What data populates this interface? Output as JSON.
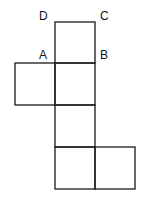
{
  "diagram": {
    "type": "cube-net",
    "line_color": "#1a1a1a",
    "labels": [
      {
        "id": "D",
        "text": "D",
        "x": 39,
        "y": 10
      },
      {
        "id": "C",
        "text": "C",
        "x": 100,
        "y": 10
      },
      {
        "id": "A",
        "text": "A",
        "x": 39,
        "y": 49
      },
      {
        "id": "B",
        "text": "B",
        "x": 100,
        "y": 49
      }
    ],
    "squares": [
      {
        "name": "top-face",
        "x": 55,
        "y": 22,
        "w": 40,
        "h": 41
      },
      {
        "name": "left-face",
        "x": 15,
        "y": 63,
        "w": 40,
        "h": 42
      },
      {
        "name": "center-face",
        "x": 55,
        "y": 63,
        "w": 40,
        "h": 42
      },
      {
        "name": "middle-lower-face",
        "x": 55,
        "y": 105,
        "w": 40,
        "h": 42
      },
      {
        "name": "bottom-left-face",
        "x": 55,
        "y": 147,
        "w": 40,
        "h": 42
      },
      {
        "name": "bottom-right-face",
        "x": 95,
        "y": 147,
        "w": 40,
        "h": 42
      }
    ]
  }
}
